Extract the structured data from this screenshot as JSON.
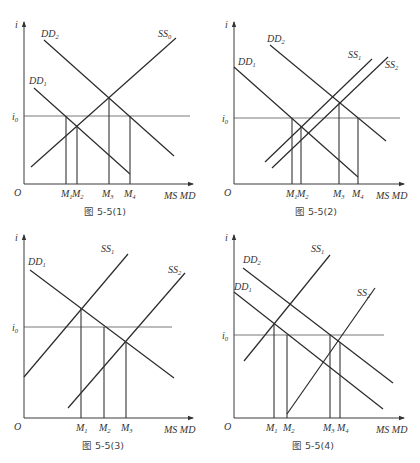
{
  "figures": [
    {
      "id": "fig-5-5-1",
      "caption": "图 5-5(1)",
      "axis": {
        "y_label": "i",
        "x_label": "MS MD",
        "origin": "O",
        "rate_label": "i",
        "rate_sub": "0"
      },
      "curves": [
        {
          "name": "DD",
          "sub": "2",
          "type": "demand"
        },
        {
          "name": "DD",
          "sub": "1",
          "type": "demand"
        },
        {
          "name": "SS",
          "sub": "0",
          "type": "supply"
        }
      ],
      "m_ticks": [
        {
          "name": "M",
          "sub": "1"
        },
        {
          "name": "M",
          "sub": "2"
        },
        {
          "name": "M",
          "sub": "3"
        },
        {
          "name": "M",
          "sub": "4"
        }
      ]
    },
    {
      "id": "fig-5-5-2",
      "caption": "图 5-5(2)",
      "axis": {
        "y_label": "i",
        "x_label": "MS MD",
        "origin": "O",
        "rate_label": "i",
        "rate_sub": "0"
      },
      "curves": [
        {
          "name": "DD",
          "sub": "2",
          "type": "demand"
        },
        {
          "name": "DD",
          "sub": "1",
          "type": "demand"
        },
        {
          "name": "SS",
          "sub": "1",
          "type": "supply"
        },
        {
          "name": "SS",
          "sub": "2",
          "type": "supply"
        }
      ],
      "m_ticks": [
        {
          "name": "M",
          "sub": "1"
        },
        {
          "name": "M",
          "sub": "2"
        },
        {
          "name": "M",
          "sub": "3"
        },
        {
          "name": "M",
          "sub": "4"
        }
      ]
    },
    {
      "id": "fig-5-5-3",
      "caption": "图 5-5(3)",
      "axis": {
        "y_label": "i",
        "x_label": "MS MD",
        "origin": "O",
        "rate_label": "i",
        "rate_sub": "0"
      },
      "curves": [
        {
          "name": "DD",
          "sub": "1",
          "type": "demand"
        },
        {
          "name": "SS",
          "sub": "1",
          "type": "supply"
        },
        {
          "name": "SS",
          "sub": "2",
          "type": "supply"
        }
      ],
      "m_ticks": [
        {
          "name": "M",
          "sub": "1"
        },
        {
          "name": "M",
          "sub": "2"
        },
        {
          "name": "M",
          "sub": "3"
        }
      ]
    },
    {
      "id": "fig-5-5-4",
      "caption": "图 5-5(4)",
      "axis": {
        "y_label": "i",
        "x_label": "MS MD",
        "origin": "O",
        "rate_label": "i",
        "rate_sub": "0"
      },
      "curves": [
        {
          "name": "DD",
          "sub": "2",
          "type": "demand"
        },
        {
          "name": "DD",
          "sub": "1",
          "type": "demand"
        },
        {
          "name": "SS",
          "sub": "1",
          "type": "supply"
        },
        {
          "name": "SS",
          "sub": "2",
          "type": "supply"
        }
      ],
      "m_ticks": [
        {
          "name": "M",
          "sub": "1"
        },
        {
          "name": "M",
          "sub": "2"
        },
        {
          "name": "M",
          "sub": "3"
        },
        {
          "name": "M",
          "sub": "4"
        }
      ]
    }
  ]
}
